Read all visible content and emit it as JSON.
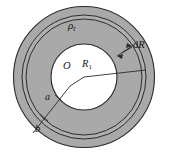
{
  "figure": {
    "type": "physics-diagram",
    "canvas": {
      "width": 169,
      "height": 155,
      "background": "#ffffff"
    },
    "colors": {
      "annulus_fill": "#a9a9a9",
      "strip_fill": "#b2b2b2",
      "inner_fill": "#ffffff",
      "stroke": "#2b2b2b",
      "label": "#141414"
    },
    "geometry": {
      "center": {
        "x": 84,
        "y": 77
      },
      "outer_radius_b": 71,
      "strip_outer_radius": 62,
      "strip_inner_radius": 58,
      "inner_radius_a": 33
    },
    "labels": {
      "rho": "ρ",
      "rho_sub": "r",
      "dR_d": "d",
      "dR_R": "R",
      "center": "O",
      "R": "R",
      "R_sub": "1",
      "a": "a",
      "b": "b"
    }
  }
}
